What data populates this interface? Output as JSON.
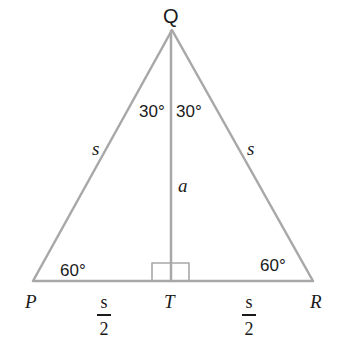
{
  "diagram": {
    "type": "equilateral-triangle-altitude",
    "vertices": {
      "apex": "Q",
      "left": "P",
      "right": "R",
      "foot": "T"
    },
    "angles": {
      "apex_left": "30°",
      "apex_right": "30°",
      "base_left": "60°",
      "base_right": "60°"
    },
    "sides": {
      "left": "s",
      "right": "s",
      "altitude": "a"
    },
    "half_base": {
      "left": {
        "num": "s",
        "den": "2"
      },
      "right": {
        "num": "s",
        "den": "2"
      }
    },
    "colors": {
      "line": "#a8a8a8",
      "text": "#1a1a1a",
      "background": "#ffffff"
    }
  }
}
